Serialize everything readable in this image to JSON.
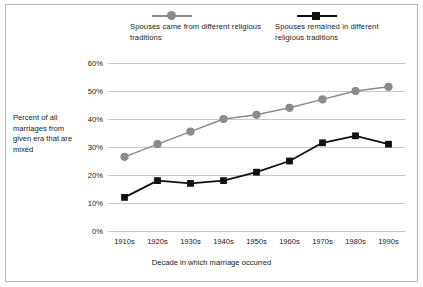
{
  "chart_data": {
    "type": "line",
    "title": "",
    "xlabel": "Decade in which marriage occurred",
    "ylabel": "Percent of all marriages from given era that are mixed",
    "categories": [
      "1910s",
      "1920s",
      "1930s",
      "1940s",
      "1950s",
      "1960s",
      "1970s",
      "1980s",
      "1990s"
    ],
    "ylim": [
      0,
      60
    ],
    "yticks": [
      "0%",
      "10%",
      "20%",
      "30%",
      "40%",
      "50%",
      "60%"
    ],
    "ytick_values": [
      0,
      10,
      20,
      30,
      40,
      50,
      60
    ],
    "grid": true,
    "legend_position": "top",
    "series": [
      {
        "name": "Spouses came from different religious traditions",
        "color": "#8a8a8a",
        "marker": "circle",
        "values": [
          26.5,
          31,
          35.5,
          40,
          41.5,
          44,
          47,
          50,
          51.5
        ]
      },
      {
        "name": "Spouses remained in different religious traditions",
        "color": "#111111",
        "marker": "square",
        "values": [
          12,
          18,
          17,
          18,
          21,
          25,
          31.5,
          34,
          31
        ]
      }
    ]
  },
  "legend": {
    "entries": [
      {
        "label": "Spouses came from different religious traditions"
      },
      {
        "label": "Spouses remained in different religious traditions"
      }
    ]
  }
}
